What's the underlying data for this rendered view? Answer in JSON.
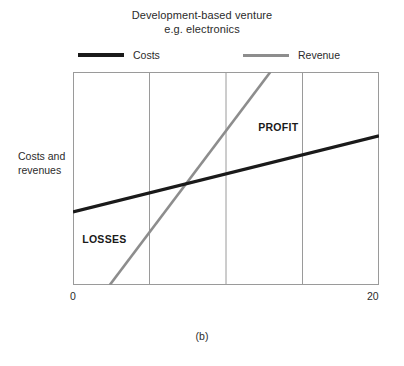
{
  "figure": {
    "caption": "(b)"
  },
  "chart_data": {
    "type": "line",
    "title": "Development-based venture e.g. electronics",
    "title_lines": [
      "Development-based venture",
      "e.g. electronics"
    ],
    "xlabel": "",
    "ylabel": "Costs and revenues",
    "ylabel_lines": [
      "Costs and",
      "revenues"
    ],
    "xlim": [
      0,
      20
    ],
    "xticks": [
      0,
      20
    ],
    "xtick_labels": [
      "0",
      "20"
    ],
    "gridlines_x": [
      5,
      10,
      15
    ],
    "grid": true,
    "grid_color": "#9a9a9a",
    "ylim": [
      0,
      100
    ],
    "yticks": [],
    "ytick_labels": [],
    "legend_position": "above-plot",
    "series": [
      {
        "name": "Costs",
        "color": "#1a1a1a",
        "width": 3.2,
        "x": [
          0,
          20
        ],
        "values": [
          34.3,
          70.0
        ]
      },
      {
        "name": "Revenue",
        "color": "#8d8d8d",
        "width": 2.6,
        "x": [
          2.4,
          12.9
        ],
        "values": [
          0,
          100
        ]
      }
    ],
    "annotations": [
      {
        "text": "PROFIT",
        "x": 12.1,
        "y": 74.0,
        "bold": true
      },
      {
        "text": "LOSSES",
        "x": 0.6,
        "y": 21.6,
        "bold": true
      }
    ],
    "breakeven_x": 8.4
  }
}
